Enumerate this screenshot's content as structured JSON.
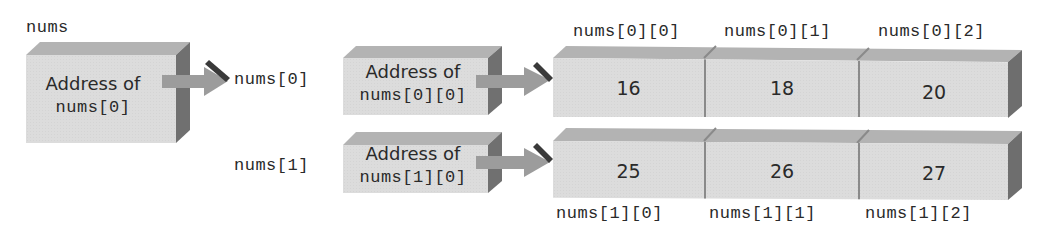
{
  "diagram": {
    "pointer": {
      "label": "nums",
      "box_text_line1": "Address of",
      "box_text_line2": "nums[0]"
    },
    "row_labels": [
      "nums[0]",
      "nums[1]"
    ],
    "row_pointers": [
      {
        "line1": "Address of",
        "line2": "nums[0][0]"
      },
      {
        "line1": "Address of",
        "line2": "nums[1][0]"
      }
    ],
    "rows": [
      {
        "element_labels": [
          "nums[0][0]",
          "nums[0][1]",
          "nums[0][2]"
        ],
        "values": [
          "16",
          "18",
          "20"
        ],
        "label_position": "above"
      },
      {
        "element_labels": [
          "nums[1][0]",
          "nums[1][1]",
          "nums[1][2]"
        ],
        "values": [
          "25",
          "26",
          "27"
        ],
        "label_position": "below"
      }
    ]
  },
  "colors": {
    "front_face": "#dcdcdc",
    "top_face": "#b0b0b0",
    "side_face": "#6e6e6e",
    "arrow_body": "#9a9a9a",
    "arrow_head_dark": "#3a3a3a",
    "text": "#2a2a2a"
  }
}
